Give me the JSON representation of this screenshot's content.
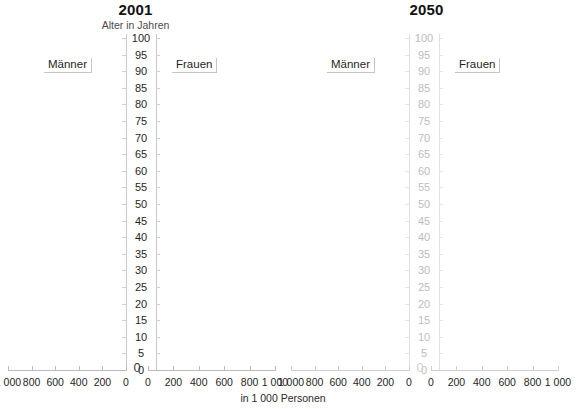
{
  "chart_data": [
    {
      "type": "bar",
      "orientation": "horizontal",
      "variant": "population-pyramid",
      "title": "2001",
      "subtitle": "Alter in Jahren",
      "xlabel": "in 1 000 Personen",
      "ylabel": "Alter in Jahren",
      "legend": [
        "Männer",
        "Frauen"
      ],
      "legend_position": "inside-upper-left-and-upper-right",
      "grid": false,
      "ylim": [
        0,
        100
      ],
      "y_tick_step": 5,
      "y_ticks": [
        0,
        5,
        10,
        15,
        20,
        25,
        30,
        35,
        40,
        45,
        50,
        55,
        60,
        65,
        70,
        75,
        80,
        85,
        90,
        95,
        100
      ],
      "x_left_ticks": [
        "1 000",
        "800",
        "600",
        "400",
        "200",
        "0"
      ],
      "x_right_ticks": [
        "0",
        "200",
        "400",
        "600",
        "800",
        "1 000"
      ],
      "x_left_values": [
        1000,
        800,
        600,
        400,
        200,
        0
      ],
      "x_right_values": [
        0,
        200,
        400,
        600,
        800,
        1000
      ],
      "series": [
        {
          "name": "Männer",
          "side": "left",
          "values": []
        },
        {
          "name": "Frauen",
          "side": "right",
          "values": []
        }
      ],
      "note": "plot area rendered empty - no bars drawn"
    },
    {
      "type": "bar",
      "orientation": "horizontal",
      "variant": "population-pyramid",
      "title": "2050",
      "subtitle": "",
      "xlabel": "in 1 000 Personen",
      "ylabel": "",
      "legend": [
        "Männer",
        "Frauen"
      ],
      "legend_position": "inside-upper-left-and-upper-right",
      "grid": false,
      "ylim": [
        0,
        100
      ],
      "y_tick_step": 5,
      "y_ticks": [
        0,
        5,
        10,
        15,
        20,
        25,
        30,
        35,
        40,
        45,
        50,
        55,
        60,
        65,
        70,
        75,
        80,
        85,
        90,
        95,
        100
      ],
      "x_left_ticks": [
        "1 000",
        "800",
        "600",
        "400",
        "200",
        "0"
      ],
      "x_right_ticks": [
        "0",
        "200",
        "400",
        "600",
        "800",
        "1 000"
      ],
      "x_left_values": [
        1000,
        800,
        600,
        400,
        200,
        0
      ],
      "x_right_values": [
        0,
        200,
        400,
        600,
        800,
        1000
      ],
      "series": [
        {
          "name": "Männer",
          "side": "left",
          "values": []
        },
        {
          "name": "Frauen",
          "side": "right",
          "values": []
        }
      ],
      "note": "plot area rendered empty - no bars drawn; axis labels faded light gray"
    }
  ],
  "panels": [
    {
      "title": "2001",
      "subtitle": "Alter in Jahren",
      "men_label": "Männer",
      "women_label": "Frauen",
      "center_zero": "0"
    },
    {
      "title": "2050",
      "subtitle": "",
      "men_label": "Männer",
      "women_label": "Frauen",
      "center_zero": "0"
    }
  ],
  "axis": {
    "ages": [
      "100",
      "95",
      "90",
      "85",
      "80",
      "75",
      "70",
      "65",
      "60",
      "55",
      "50",
      "45",
      "40",
      "35",
      "30",
      "25",
      "20",
      "15",
      "10",
      "5",
      "0"
    ],
    "x_left": [
      "1 000",
      "800",
      "600",
      "400",
      "200",
      "0"
    ],
    "x_right": [
      "0",
      "200",
      "400",
      "600",
      "800",
      "1 000"
    ]
  },
  "footer": {
    "note": "in 1 000 Personen"
  },
  "colors": {
    "title": "#121212",
    "text": "#1f1f1f",
    "muted": "#bdbdbd",
    "rule": "#c9c9c9",
    "rule_faded": "#e0e0e0",
    "background": "#ffffff"
  }
}
